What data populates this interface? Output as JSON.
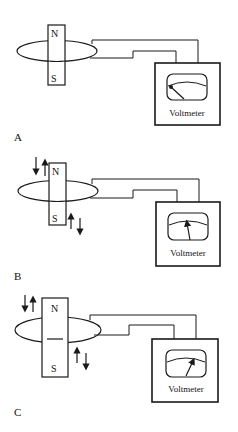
{
  "panels": [
    {
      "label": "A",
      "north_label": "N",
      "south_label": "S",
      "meter_label": "Voltmeter",
      "needle": "left",
      "arrows": false,
      "magnet_divider": false
    },
    {
      "label": "B",
      "north_label": "N",
      "south_label": "S",
      "meter_label": "Voltmeter",
      "needle": "center",
      "arrows": true,
      "magnet_divider": false
    },
    {
      "label": "C",
      "north_label": "N",
      "south_label": "S",
      "meter_label": "Voltmeter",
      "needle": "right",
      "arrows": true,
      "magnet_divider": true
    }
  ],
  "colors": {
    "line": "#1a1a1a",
    "background": "#ffffff"
  }
}
